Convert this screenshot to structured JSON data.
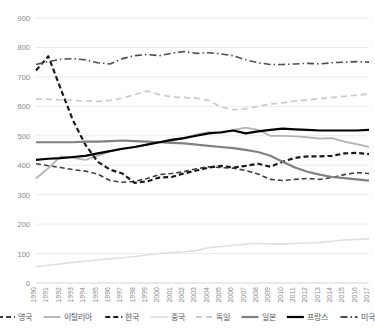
{
  "chart_data": {
    "type": "line",
    "title": "",
    "xlabel": "",
    "ylabel": "",
    "ylim": [
      0,
      900
    ],
    "ytick_step": 100,
    "yticks": [
      "0",
      "100",
      "200",
      "300",
      "400",
      "500",
      "600",
      "700",
      "800",
      "900"
    ],
    "grid": true,
    "legend_position": "bottom",
    "x": [
      "1990",
      "1991",
      "1992",
      "1993",
      "1994",
      "1995",
      "1996",
      "1997",
      "1998",
      "1999",
      "2000",
      "2001",
      "2002",
      "2003",
      "2004",
      "2005",
      "2006",
      "2007",
      "2008",
      "2009",
      "2010",
      "2011",
      "2012",
      "2013",
      "2014",
      "2015",
      "2016",
      "2017"
    ],
    "series": [
      {
        "name": "영국",
        "style": "dashed",
        "color": "#404040",
        "width": 1.6,
        "values": [
          405,
          398,
          392,
          385,
          380,
          370,
          348,
          342,
          345,
          355,
          368,
          372,
          378,
          388,
          395,
          392,
          390,
          382,
          370,
          352,
          348,
          352,
          355,
          352,
          358,
          368,
          375,
          372
        ]
      },
      {
        "name": "이탈리아",
        "style": "solid",
        "color": "#b3b3b3",
        "width": 1.8,
        "values": [
          355,
          390,
          430,
          425,
          418,
          432,
          448,
          455,
          462,
          470,
          478,
          482,
          492,
          505,
          512,
          508,
          520,
          528,
          520,
          500,
          500,
          498,
          495,
          490,
          492,
          480,
          472,
          462
        ]
      },
      {
        "name": "한국",
        "style": "dashed-heavy",
        "color": "#1a1a1a",
        "width": 2.2,
        "values": [
          722,
          770,
          660,
          552,
          470,
          412,
          385,
          372,
          340,
          345,
          358,
          360,
          372,
          382,
          392,
          398,
          392,
          398,
          405,
          395,
          412,
          425,
          430,
          430,
          432,
          440,
          442,
          438
        ]
      },
      {
        "name": "중국",
        "style": "solid",
        "color": "#e0e0e0",
        "width": 1.6,
        "values": [
          55,
          60,
          65,
          70,
          74,
          78,
          82,
          86,
          90,
          95,
          100,
          103,
          106,
          110,
          120,
          124,
          128,
          132,
          134,
          133,
          132,
          134,
          136,
          138,
          142,
          146,
          148,
          150
        ]
      },
      {
        "name": "독일",
        "style": "dashed-light",
        "color": "#cccccc",
        "width": 1.8,
        "values": [
          625,
          624,
          622,
          620,
          618,
          617,
          620,
          628,
          640,
          652,
          640,
          632,
          630,
          628,
          620,
          598,
          588,
          592,
          600,
          608,
          612,
          618,
          622,
          626,
          630,
          634,
          638,
          642
        ]
      },
      {
        "name": "일본",
        "style": "solid",
        "color": "#808080",
        "width": 2.2,
        "values": [
          478,
          478,
          478,
          478,
          480,
          480,
          482,
          484,
          482,
          480,
          478,
          476,
          474,
          470,
          466,
          462,
          458,
          452,
          445,
          432,
          412,
          392,
          378,
          368,
          360,
          356,
          352,
          348
        ]
      },
      {
        "name": "프랑스",
        "style": "solid",
        "color": "#000000",
        "width": 2.2,
        "values": [
          418,
          422,
          424,
          428,
          432,
          440,
          448,
          456,
          462,
          470,
          478,
          486,
          492,
          500,
          508,
          512,
          518,
          508,
          515,
          520,
          524,
          522,
          520,
          518,
          518,
          518,
          518,
          520
        ]
      },
      {
        "name": "미국",
        "style": "dashdot",
        "color": "#4d4d4d",
        "width": 1.6,
        "values": [
          742,
          752,
          760,
          762,
          758,
          748,
          744,
          762,
          772,
          776,
          772,
          780,
          786,
          780,
          782,
          778,
          772,
          758,
          748,
          742,
          742,
          744,
          746,
          744,
          748,
          750,
          752,
          750
        ]
      }
    ]
  }
}
